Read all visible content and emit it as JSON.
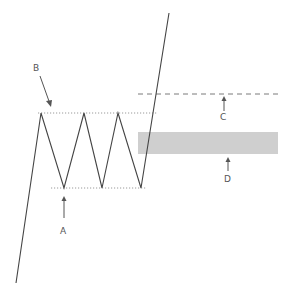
{
  "diagram": {
    "type": "triple-top-breakout-pattern",
    "colors": {
      "price_line": "#444444",
      "dotted_line": "#9a9a9a",
      "dashed_line": "#7a7a7a",
      "zone_fill": "#cfcfcf",
      "label": "#555555"
    },
    "labels": {
      "A": "A",
      "B": "B",
      "C": "C",
      "D": "D"
    },
    "price_path": [
      [
        16,
        283
      ],
      [
        41,
        113
      ],
      [
        64,
        188
      ],
      [
        84,
        113
      ],
      [
        102,
        188
      ],
      [
        118,
        113
      ],
      [
        141,
        188
      ],
      [
        169,
        13
      ]
    ],
    "resistance_line": {
      "x1": 38,
      "x2": 157,
      "y": 113
    },
    "support_line": {
      "x1": 51,
      "x2": 146,
      "y": 188
    },
    "target_line_C": {
      "x1": 138,
      "x2": 278,
      "y": 94
    },
    "zone_D": {
      "x": 138,
      "y": 132,
      "width": 140,
      "height": 22
    }
  }
}
